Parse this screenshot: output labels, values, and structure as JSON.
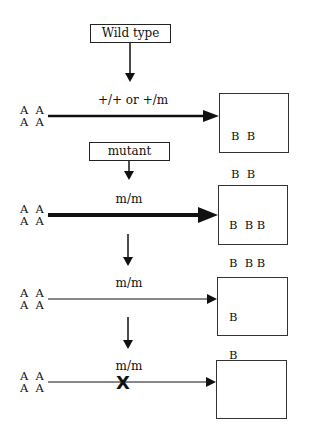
{
  "diagram": {
    "top_labels": {
      "wild_type": "Wild type",
      "mutant": "mutant"
    },
    "rows": [
      {
        "genotype": "+/+  or  +/m",
        "input": [
          "A  A",
          "A  A"
        ],
        "arrow": "thick",
        "output": [
          "B  B",
          "B  B"
        ],
        "blocked": false
      },
      {
        "genotype": "m/m",
        "input": [
          "A  A",
          "A  A"
        ],
        "arrow": "very-thick",
        "output": [
          "B  B B",
          "B  B B",
          "B  B B"
        ],
        "blocked": false
      },
      {
        "genotype": "m/m",
        "input": [
          "A  A",
          "A  A"
        ],
        "arrow": "thin",
        "output": [
          "B",
          "B"
        ],
        "blocked": false
      },
      {
        "genotype": "m/m",
        "input": [
          "A  A",
          "A  A"
        ],
        "arrow": "thin",
        "output": [],
        "blocked": true,
        "block_symbol": "X"
      }
    ]
  }
}
